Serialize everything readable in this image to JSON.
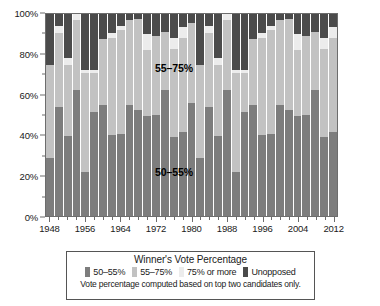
{
  "chart_data": {
    "type": "bar",
    "subtype": "stacked-100-percent",
    "title": "",
    "xlabel": "",
    "ylabel": "",
    "ylim": [
      0,
      100
    ],
    "ytick_labels": [
      "0%",
      "20%",
      "40%",
      "60%",
      "80%",
      "100%"
    ],
    "ytick_values": [
      0,
      20,
      40,
      60,
      80,
      100
    ],
    "xtick_labels": [
      "1948",
      "1956",
      "1964",
      "1972",
      "1980",
      "1988",
      "1996",
      "2004",
      "2012"
    ],
    "grid": false,
    "legend_position": "below",
    "categories": [
      "1948",
      "1950",
      "1952",
      "1954",
      "1956",
      "1958",
      "1960",
      "1962",
      "1964",
      "1966",
      "1968",
      "1970",
      "1972",
      "1974",
      "1976",
      "1978",
      "1980",
      "1982",
      "1984",
      "1986",
      "1988",
      "1990",
      "1992",
      "1994",
      "1996",
      "1998",
      "2000",
      "2002",
      "2004",
      "2006",
      "2008",
      "2010",
      "2012"
    ],
    "series": [
      {
        "name": "50–55%",
        "color": "#7d7d7d",
        "values": [
          28.5,
          53.8,
          39.5,
          62.5,
          22.0,
          51.5,
          54.8,
          40.0,
          40.5,
          54.8,
          52.5,
          49.5,
          50.0,
          62.5,
          39.0,
          41.5,
          56.0,
          28.5,
          53.8,
          39.5,
          62.5,
          22.0,
          51.5,
          54.8,
          40.0,
          40.5,
          54.8,
          52.5,
          49.5,
          50.0,
          62.5,
          39.0,
          41.5
        ]
      },
      {
        "name": "55–75%",
        "color": "#c2c2c2",
        "values": [
          46.5,
          37.0,
          35.5,
          34.5,
          49.0,
          19.5,
          33.0,
          48.0,
          51.5,
          42.0,
          45.0,
          32.5,
          39.0,
          28.5,
          43.5,
          46.5,
          39.5,
          46.5,
          37.0,
          35.5,
          34.5,
          49.0,
          19.5,
          33.0,
          48.0,
          51.5,
          42.0,
          45.0,
          32.5,
          39.0,
          28.5,
          43.5,
          46.5
        ]
      },
      {
        "name": "75% or more",
        "color": "#ececec",
        "values": [
          0.0,
          3.2,
          3.0,
          3.0,
          1.5,
          1.5,
          0.0,
          2.5,
          2.0,
          0.0,
          0.0,
          8.0,
          0.0,
          0.0,
          5.5,
          5.5,
          0.0,
          0.0,
          3.2,
          3.0,
          3.0,
          1.5,
          1.5,
          0.0,
          2.5,
          2.0,
          0.0,
          0.0,
          8.0,
          0.0,
          0.0,
          5.5,
          5.5
        ]
      },
      {
        "name": "Unopposed",
        "color": "#4b4b4b",
        "values": [
          25.0,
          6.0,
          22.0,
          0.0,
          27.5,
          27.5,
          12.2,
          9.5,
          6.0,
          3.2,
          2.5,
          10.0,
          11.0,
          9.0,
          12.0,
          6.5,
          4.5,
          25.0,
          6.0,
          22.0,
          0.0,
          27.5,
          27.5,
          12.2,
          9.5,
          6.0,
          3.2,
          2.5,
          10.0,
          11.0,
          9.0,
          12.0,
          6.5
        ]
      }
    ],
    "annotations": [
      {
        "text": "55–75%",
        "x_pct": 44.0,
        "y_pct": 73.0
      },
      {
        "text": "50–55%",
        "x_pct": 44.0,
        "y_pct": 22.0
      }
    ]
  },
  "legend": {
    "title": "Winner's Vote Percentage",
    "items": [
      {
        "label": "50–55%",
        "color": "#7d7d7d"
      },
      {
        "label": "55–75%",
        "color": "#c2c2c2"
      },
      {
        "label": "75% or more",
        "color": "#ececec"
      },
      {
        "label": "Unopposed",
        "color": "#4b4b4b"
      }
    ],
    "note": "Vote percentage computed based on top two candidates only."
  }
}
